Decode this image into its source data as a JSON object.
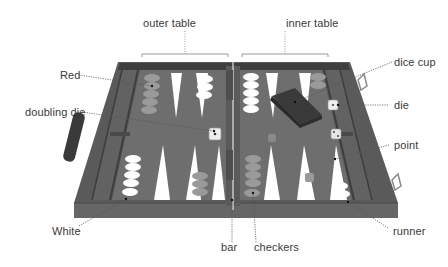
{
  "diagram": {
    "labels": {
      "outer_table": "outer table",
      "inner_table": "inner table",
      "red": "Red",
      "doubling_die": "doubling die",
      "dice_cup": "dice cup",
      "die": "die",
      "point": "point",
      "white": "White",
      "bar": "bar",
      "checkers": "checkers",
      "runner": "runner"
    },
    "colors": {
      "board": "#6e6e6e",
      "frame": "#5a5a5a",
      "frame_dark": "#3e3e3e",
      "point_light": "#ffffff",
      "point_dark": "#646464",
      "red_checker": "#9a9a9a",
      "white_checker": "#ffffff",
      "leader_line": "#555555"
    },
    "pieces": {
      "red_checkers_outer_top": 5,
      "white_checkers_outer_top": 3,
      "white_checkers_inner_top": 5,
      "red_checkers_inner_top": 2,
      "white_checkers_outer_bottom": 5,
      "red_checkers_outer_bottom": 3,
      "red_checkers_inner_bottom": 5,
      "white_runner_checkers": 2,
      "dice": 2,
      "doubling_die": 1,
      "dice_cup": 1
    }
  }
}
